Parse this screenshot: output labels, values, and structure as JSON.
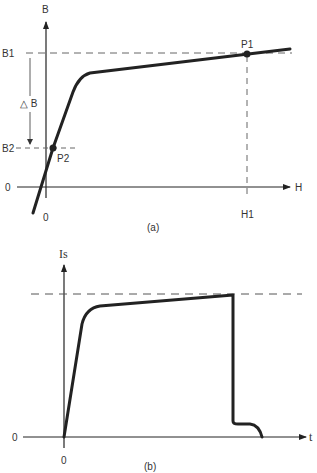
{
  "figure_a": {
    "caption": "(a)",
    "y_axis_label": "B",
    "x_axis_label": "H",
    "origin_y_label": "0",
    "origin_x_label": "0",
    "b1_label": "B1",
    "b2_label": "B2",
    "delta_b_label": "△ B",
    "h1_label": "H1",
    "p1_label": "P1",
    "p2_label": "P2"
  },
  "figure_b": {
    "caption": "(b)",
    "y_axis_label": "Is",
    "x_axis_label": "t",
    "origin_y_label": "0",
    "origin_x_label": "0"
  },
  "colors": {
    "stroke": "#222222",
    "dashed": "#666666",
    "background": "#ffffff"
  }
}
